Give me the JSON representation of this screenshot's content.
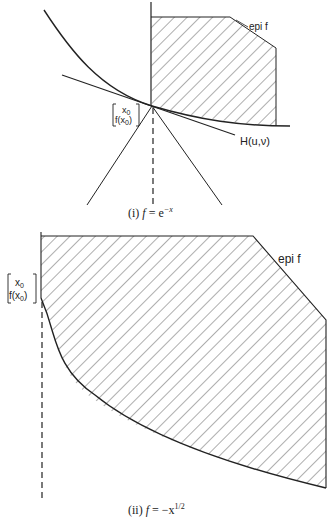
{
  "figure_i": {
    "epi_label": "epi f",
    "point_label_top": "x",
    "point_label_top_sub": "0",
    "point_label_bottom": "f(x",
    "point_label_bottom_sub": "0",
    "point_label_bottom_end": ")",
    "hyperplane_label": "H(u,ν)",
    "caption_prefix": "(i)",
    "caption_f": "f",
    "caption_eq": " = e",
    "caption_exp": "−x"
  },
  "figure_ii": {
    "epi_label": "epi f",
    "point_label_top": "x",
    "point_label_top_sub": "0",
    "point_label_bottom": "f(x",
    "point_label_bottom_sub": "0",
    "point_label_bottom_end": ")",
    "caption_prefix": "(ii)",
    "caption_f": "f",
    "caption_eq": " = −x",
    "caption_exp": "1/2"
  }
}
